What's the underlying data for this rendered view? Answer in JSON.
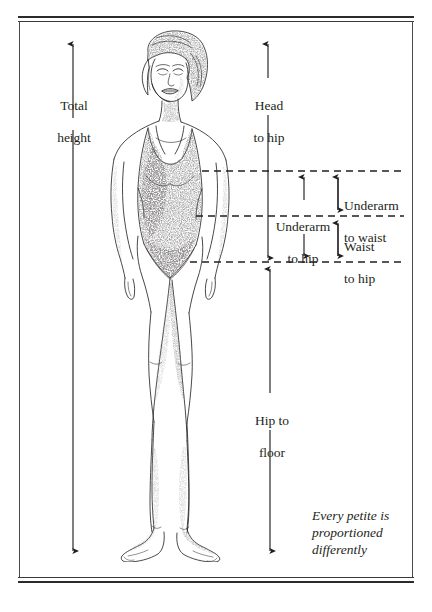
{
  "page": {
    "background_color": "#ffffff",
    "ink_color": "#231f20",
    "rule_color": "#2b2b2b"
  },
  "frame": {
    "style": "double-rule-top-and-bottom",
    "top_rule_label": "top-double-rule",
    "bottom_rule_label": "bottom-double-rule"
  },
  "illustration": {
    "name": "pencil-sketch-woman-in-leotard",
    "description": "Pencil sketch of a standing woman in a sleeveless leotard, facing forward, bob haircut",
    "medium": "graphite pencil drawing"
  },
  "measurements": [
    {
      "id": "total-height",
      "label": "Total\nheight",
      "line1": "Total",
      "line2": "height",
      "arrow": "double-headed-vertical",
      "side": "left"
    },
    {
      "id": "head-to-hip",
      "label": "Head\nto hip",
      "line1": "Head",
      "line2": "to hip",
      "arrow": "double-headed-vertical",
      "side": "right"
    },
    {
      "id": "underarm-to-hip",
      "label": "Underarm\nto hip",
      "line1": "Underarm",
      "line2": "to hip",
      "arrow": "double-headed-vertical",
      "side": "right"
    },
    {
      "id": "underarm-to-waist",
      "label": "Underarm\nto waist",
      "line1": "Underarm",
      "line2": "to waist",
      "arrow": "double-headed-vertical",
      "side": "right"
    },
    {
      "id": "waist-to-hip",
      "label": "Waist\nto hip",
      "line1": "Waist",
      "line2": "to hip",
      "arrow": "double-headed-vertical",
      "side": "right"
    },
    {
      "id": "hip-to-floor",
      "label": "Hip to\nfloor",
      "line1": "Hip to",
      "line2": "floor",
      "arrow": "double-headed-vertical",
      "side": "right"
    }
  ],
  "guide_lines": [
    {
      "id": "underarm-guide",
      "name": "underarm-dashed-line",
      "style": "dashed"
    },
    {
      "id": "waist-guide",
      "name": "waist-dashed-line",
      "style": "dashed"
    },
    {
      "id": "hip-guide",
      "name": "hip-dashed-line",
      "style": "dashed"
    }
  ],
  "caption": {
    "line1": "Every petite is",
    "line2": "proportioned",
    "line3": "differently",
    "full_text": "Every petite is proportioned differently",
    "style": "italic"
  }
}
